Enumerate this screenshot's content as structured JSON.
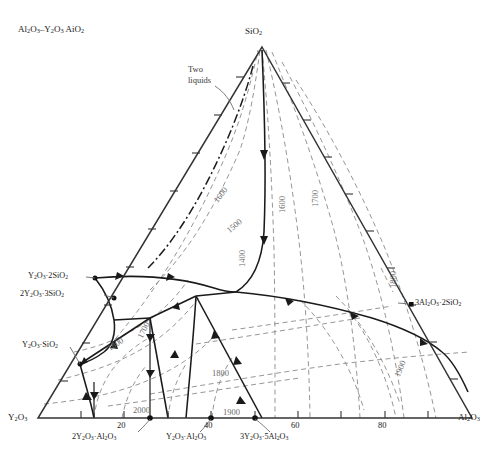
{
  "figure": {
    "title": "Al2O3–Y2O3 AiO2",
    "title_html": "Al<sub>2</sub>O<sub>3</sub>–Y<sub>2</sub>O<sub>3</sub> AiO<sub>2</sub>",
    "diagram_type": "ternary-phase-diagram",
    "annotation_two_liquids_line1": "Two",
    "annotation_two_liquids_line2": "liquids"
  },
  "vertices": {
    "top": "SiO2",
    "top_html": "SiO<sub>2</sub>",
    "bottom_left": "Y2O3",
    "bottom_left_html": "Y<sub>2</sub>O<sub>3</sub>",
    "bottom_right": "Al2O3",
    "bottom_right_html": "Al<sub>2</sub>O<sub>3</sub>"
  },
  "axis": {
    "bottom_ticks": [
      "20",
      "40",
      "60",
      "80"
    ],
    "bottom_tick_values": [
      20,
      40,
      60,
      80
    ]
  },
  "compounds_left": [
    {
      "label_html": "Y<sub>2</sub>O<sub>3</sub>&middot;2SiO<sub>2</sub>",
      "label": "Y2O3·2SiO2"
    },
    {
      "label_html": "2Y<sub>2</sub>O<sub>3</sub>&middot;3SiO<sub>2</sub>",
      "label": "2Y2O3·3SiO2"
    },
    {
      "label_html": "Y<sub>2</sub>O<sub>3</sub>&middot;SiO<sub>2</sub>",
      "label": "Y2O3·SiO2"
    }
  ],
  "compounds_right": [
    {
      "label_html": "3Al<sub>2</sub>O<sub>3</sub>&middot;2SiO<sub>2</sub>",
      "label": "3Al2O3·2SiO2"
    }
  ],
  "compounds_bottom": [
    {
      "label_html": "2Y<sub>2</sub>O<sub>3</sub>&middot;Al<sub>2</sub>O<sub>3</sub>",
      "label": "2Y2O3·Al2O3"
    },
    {
      "label_html": "Y<sub>2</sub>O<sub>3</sub>&middot;Al<sub>2</sub>O<sub>3</sub>",
      "label": "Y2O3·Al2O3"
    },
    {
      "label_html": "3Y<sub>2</sub>O<sub>3</sub>&middot;5Al<sub>2</sub>O<sub>3</sub>",
      "label": "3Y2O3·5Al2O3"
    }
  ],
  "isotherm_labels": [
    {
      "text": "1600",
      "x": 212,
      "y": 199,
      "rot": -52
    },
    {
      "text": "1500",
      "x": 225,
      "y": 228,
      "rot": -40
    },
    {
      "text": "1400",
      "x": 238,
      "y": 267,
      "rot": -90
    },
    {
      "text": "1600",
      "x": 278,
      "y": 213,
      "rot": -90
    },
    {
      "text": "1700",
      "x": 311,
      "y": 207,
      "rot": -90
    },
    {
      "text": "1800",
      "x": 389,
      "y": 288,
      "rot": -90
    },
    {
      "text": "1900",
      "x": 393,
      "y": 375,
      "rot": -68
    },
    {
      "text": "1800",
      "x": 106,
      "y": 345,
      "rot": -32
    },
    {
      "text": "1700",
      "x": 136,
      "y": 336,
      "rot": -64
    },
    {
      "text": "1800",
      "x": 212,
      "y": 369,
      "rot": 0
    },
    {
      "text": "2000",
      "x": 133,
      "y": 406,
      "rot": 0
    },
    {
      "text": "1900",
      "x": 223,
      "y": 408,
      "rot": 0
    }
  ],
  "chart_data": {
    "type": "ternary-phase-diagram",
    "title": "Al2O3–Y2O3 AiO2",
    "components": [
      "SiO2",
      "Y2O3",
      "Al2O3"
    ],
    "axis_tick_labels": [
      "20",
      "40",
      "60",
      "80"
    ],
    "isotherms_degC": [
      1400,
      1500,
      1600,
      1700,
      1800,
      1900,
      2000
    ],
    "annotations": [
      "Two liquids"
    ],
    "invariant_compounds": [
      "Y2O3·2SiO2",
      "2Y2O3·3SiO2",
      "Y2O3·SiO2",
      "3Al2O3·2SiO2",
      "2Y2O3·Al2O3",
      "Y2O3·Al2O3",
      "3Y2O3·5Al2O3"
    ]
  }
}
